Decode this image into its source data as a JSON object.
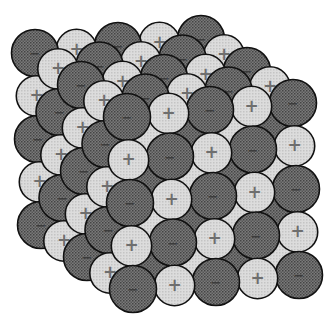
{
  "diagram": {
    "grid": {
      "cols": 5,
      "rows": 5,
      "layers": 5
    },
    "ions": {
      "cation": {
        "sign": "+",
        "fill": "#d2d2d2",
        "label_color": "#6e6e6e"
      },
      "anion": {
        "sign": "−",
        "fill": "#6c6c6c",
        "label_color": "#3c3c3c"
      }
    },
    "colors": {
      "outline": "#111111",
      "background": "#ffffff"
    }
  }
}
